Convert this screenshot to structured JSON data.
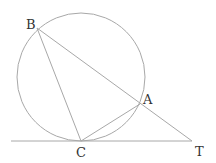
{
  "diagram": {
    "type": "geometry",
    "circle": {
      "cx": 81,
      "cy": 77,
      "r": 64
    },
    "points": {
      "B": {
        "label": "B",
        "x": 37,
        "y": 28
      },
      "A": {
        "label": "A",
        "x": 140,
        "y": 104
      },
      "C": {
        "label": "C",
        "x": 81,
        "y": 141
      },
      "T": {
        "label": "T",
        "x": 192,
        "y": 141
      }
    },
    "segments": [
      {
        "from": "B",
        "to": "T",
        "name": "secant BT"
      },
      {
        "from": "B",
        "to": "C",
        "name": "chord BC"
      },
      {
        "from": "C",
        "to": "A",
        "name": "chord CA"
      },
      {
        "from": "tangent_start",
        "to": "T",
        "name": "tangent CT"
      }
    ],
    "tangent_start": {
      "x": 11,
      "y": 141
    },
    "colors": {
      "line": "#a8a8a8",
      "label": "#333333",
      "background": "#ffffff"
    }
  }
}
